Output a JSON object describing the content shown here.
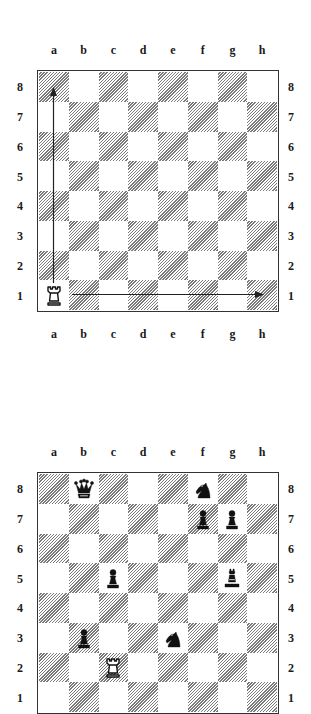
{
  "files": [
    "a",
    "b",
    "c",
    "d",
    "e",
    "f",
    "g",
    "h"
  ],
  "ranks": [
    "8",
    "7",
    "6",
    "5",
    "4",
    "3",
    "2",
    "1"
  ],
  "diagram1": {
    "pieces": [
      {
        "square": "a1",
        "color": "white",
        "type": "rook",
        "icon": "white-rook-icon"
      }
    ],
    "arrows": [
      {
        "from": "a1",
        "to": "a8",
        "label": "rook vertical move"
      },
      {
        "from": "a1",
        "to": "h1",
        "label": "rook horizontal move"
      }
    ]
  },
  "diagram2": {
    "pieces": [
      {
        "square": "b8",
        "color": "black",
        "type": "queen",
        "icon": "black-queen-icon"
      },
      {
        "square": "f8",
        "color": "black",
        "type": "knight",
        "icon": "black-knight-icon"
      },
      {
        "square": "f7",
        "color": "black",
        "type": "pawn",
        "icon": "black-pawn-icon"
      },
      {
        "square": "g7",
        "color": "black",
        "type": "pawn",
        "icon": "black-pawn-icon"
      },
      {
        "square": "c5",
        "color": "black",
        "type": "pawn",
        "icon": "black-pawn-icon"
      },
      {
        "square": "g5",
        "color": "black",
        "type": "bishop",
        "icon": "black-bishop-icon"
      },
      {
        "square": "b3",
        "color": "black",
        "type": "pawn",
        "icon": "black-pawn-icon"
      },
      {
        "square": "e3",
        "color": "black",
        "type": "knight",
        "icon": "black-knight-icon"
      },
      {
        "square": "c2",
        "color": "white",
        "type": "rook",
        "icon": "white-rook-icon"
      }
    ]
  }
}
